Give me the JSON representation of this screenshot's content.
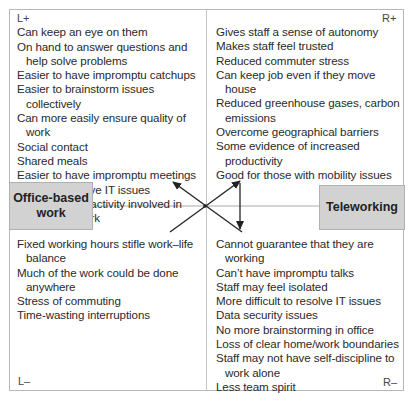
{
  "diagram": {
    "type": "force-field / quadrant comparison",
    "left_option": "Office-based work",
    "right_option": "Teleworking",
    "quadrants": {
      "left_plus": {
        "label": "L+",
        "items": [
          "Can keep an eye on them",
          "On hand to answer questions and help solve problems",
          "Easier to have impromptu catchups",
          "Easier to brainstorm issues collectively",
          "Can more easily ensure quality of work",
          "Social contact",
          "Shared meals",
          "Easier to have impromptu meetings",
          "Easier to resolve IT issues",
          "More physical activity involved in getting to work"
        ]
      },
      "right_plus": {
        "label": "R+",
        "items": [
          "Gives staff a sense of autonomy",
          "Makes staff feel trusted",
          "Reduced commuter stress",
          "Can keep job even if they move house",
          "Reduced greenhouse gases, carbon emissions",
          "Overcome geographical barriers",
          "Some evidence of increased productivity",
          "Good for those with mobility issues"
        ]
      },
      "left_minus": {
        "label": "L–",
        "items": [
          "Fixed working hours stifle work–life balance",
          "Much of the work could be done anywhere",
          "Stress of commuting",
          "Time-wasting interruptions"
        ]
      },
      "right_minus": {
        "label": "R–",
        "items": [
          "Cannot guarantee that they are working",
          "Can’t have impromptu talks",
          "Staff may feel isolated",
          "More difficult to resolve IT issues",
          "Data security issues",
          "No more brainstorming in office",
          "Loss of clear home/work boundaries",
          "Staff may not have self-discipline to work alone",
          "Less team spirit"
        ]
      }
    },
    "boxes": {
      "left": "Office-based work",
      "right": "Teleworking"
    },
    "arrows": [
      "arrow-to-left-plus",
      "arrow-to-right-plus",
      "arrow-right-plus-to-right-minus"
    ],
    "colors": {
      "box_fill": "#d2d2d2",
      "border": "#b8b8b8",
      "text": "#2a2a2a",
      "arrow": "#222222"
    }
  }
}
